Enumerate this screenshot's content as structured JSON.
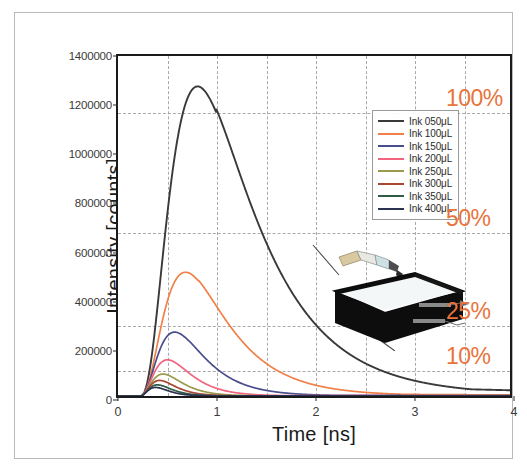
{
  "figure": {
    "background": "#ffffff",
    "border_color": "#b9b9b9",
    "accent_color": "#e8743b",
    "axis_color": "#1a1a1a"
  },
  "chart_data": {
    "type": "line",
    "title": "",
    "xlabel": "Time [ns]",
    "ylabel": "Intensity [counts]",
    "xlim": [
      0,
      4
    ],
    "ylim": [
      0,
      1400000
    ],
    "xticks": [
      "0",
      "1",
      "2",
      "3",
      "4"
    ],
    "xtick_values": [
      0,
      1,
      2,
      3,
      4
    ],
    "yticks": [
      "0",
      "200000",
      "400000",
      "600000",
      "800000",
      "1000000",
      "1200000",
      "1400000"
    ],
    "ytick_values": [
      0,
      200000,
      400000,
      600000,
      800000,
      1000000,
      1200000,
      1400000
    ],
    "grid": true,
    "grid_style": "dashed",
    "vertical_gridlines": [
      0.5,
      1.0,
      1.5,
      2.0,
      2.5,
      3.0,
      3.5
    ],
    "legend_position": "upper right",
    "series": [
      {
        "name": "Ink 050μL",
        "color": "#3a3a3a",
        "peak_time": 1.0,
        "peak_value": 1170000,
        "rise": 0.3,
        "decay": 0.62,
        "tail_end": 60000
      },
      {
        "name": "Ink 100μL",
        "color": "#f08048",
        "peak_time": 0.82,
        "peak_value": 474000,
        "rise": 0.26,
        "decay": 0.44,
        "tail_end": 12000
      },
      {
        "name": "Ink 150μL",
        "color": "#4a4e8c",
        "peak_time": 0.72,
        "peak_value": 228000,
        "rise": 0.22,
        "decay": 0.3,
        "tail_end": 4000
      },
      {
        "name": "Ink 200μL",
        "color": "#f2647e",
        "peak_time": 0.66,
        "peak_value": 115000,
        "rise": 0.19,
        "decay": 0.22,
        "tail_end": 2000
      },
      {
        "name": "Ink 250μL",
        "color": "#9a9a4a",
        "peak_time": 0.62,
        "peak_value": 62000,
        "rise": 0.17,
        "decay": 0.175,
        "tail_end": 1200
      },
      {
        "name": "Ink 300μL",
        "color": "#a84632",
        "peak_time": 0.58,
        "peak_value": 40000,
        "rise": 0.15,
        "decay": 0.145,
        "tail_end": 800
      },
      {
        "name": "Ink 350μL",
        "color": "#2f5d46",
        "peak_time": 0.55,
        "peak_value": 27000,
        "rise": 0.14,
        "decay": 0.125,
        "tail_end": 600
      },
      {
        "name": "Ink 400μL",
        "color": "#2b3350",
        "peak_time": 0.53,
        "peak_value": 19000,
        "rise": 0.13,
        "decay": 0.11,
        "tail_end": 400
      }
    ],
    "reference_lines": [
      {
        "label": "100%",
        "value": 1170000,
        "color": "#e8743b"
      },
      {
        "label": "50%",
        "value": 680000,
        "color": "#e8743b"
      },
      {
        "label": "25%",
        "value": 300000,
        "color": "#e8743b"
      },
      {
        "label": "10%",
        "value": 118000,
        "color": "#e8743b"
      }
    ]
  },
  "legend": {
    "entries": [
      {
        "label": "Ink 050μL",
        "color": "#3a3a3a"
      },
      {
        "label": "Ink 100μL",
        "color": "#f08048"
      },
      {
        "label": "Ink 150μL",
        "color": "#4a4e8c"
      },
      {
        "label": "Ink 200μL",
        "color": "#f2647e"
      },
      {
        "label": "Ink 250μL",
        "color": "#9a9a4a"
      },
      {
        "label": "Ink 300μL",
        "color": "#a84632"
      },
      {
        "label": "Ink 350μL",
        "color": "#2f5d46"
      },
      {
        "label": "Ink 400μL",
        "color": "#2b3350"
      }
    ]
  },
  "inset": {
    "name": "ink-injection-tank-illustration",
    "description": "black rectangular tank with pipette dispensing ink and two beam arrows"
  }
}
